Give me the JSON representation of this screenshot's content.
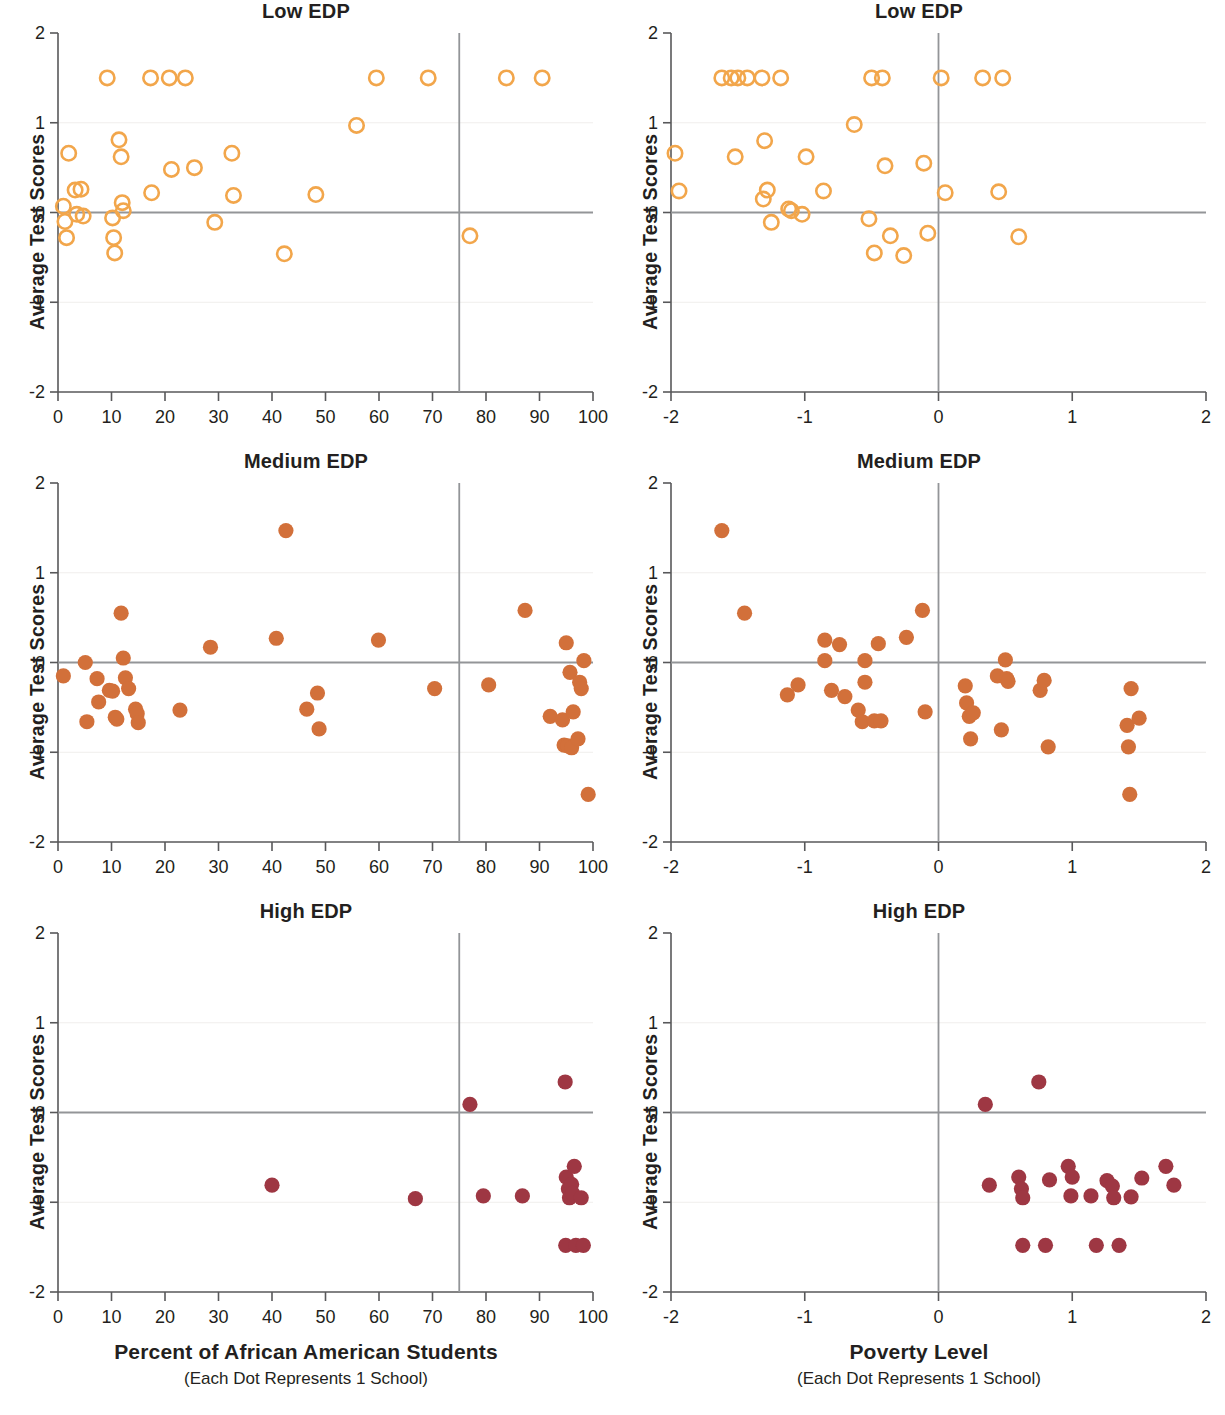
{
  "figure": {
    "background": "#ffffff",
    "columns": [
      {
        "id": "col-left",
        "axis_title": "Percent of African American Students",
        "axis_subtitle": "(Each Dot Represents 1 School)"
      },
      {
        "id": "col-right",
        "axis_title": "Poverty Level",
        "axis_subtitle": "(Each Dot Represents 1 School)"
      }
    ]
  },
  "chart_data": [
    {
      "id": "low-edp-race",
      "type": "scatter",
      "title": "Low EDP",
      "xlabel": "Percent of African American Students",
      "xsublabel": "(Each Dot Represents 1 School)",
      "ylabel": "Average Test Scores",
      "xlim": [
        0,
        100
      ],
      "ylim": [
        -2,
        2
      ],
      "xticks": [
        0,
        10,
        20,
        30,
        40,
        50,
        60,
        70,
        80,
        90,
        100
      ],
      "xtick_labels": [
        "0",
        "10",
        "20",
        "30",
        "40",
        "50",
        "60",
        "70",
        "80",
        "90",
        "100"
      ],
      "yticks": [
        -2,
        -1,
        0,
        1,
        2
      ],
      "ytick_labels": [
        "-2",
        "-1",
        "0",
        "1",
        "2"
      ],
      "grid": false,
      "legend": "none",
      "marker": "open-circle",
      "color": "#F2A64B",
      "reference_lines": {
        "vertical_x": 75,
        "horizontal_y": 0
      },
      "points": [
        [
          1.0,
          0.07
        ],
        [
          1.3,
          -0.1
        ],
        [
          1.6,
          -0.28
        ],
        [
          2.0,
          0.66
        ],
        [
          3.2,
          0.25
        ],
        [
          3.5,
          -0.02
        ],
        [
          4.3,
          0.26
        ],
        [
          4.7,
          -0.04
        ],
        [
          9.2,
          1.5
        ],
        [
          10.2,
          -0.06
        ],
        [
          10.4,
          -0.28
        ],
        [
          10.6,
          -0.45
        ],
        [
          11.4,
          0.81
        ],
        [
          11.8,
          0.62
        ],
        [
          12.0,
          0.11
        ],
        [
          12.2,
          0.02
        ],
        [
          17.3,
          1.5
        ],
        [
          17.5,
          0.22
        ],
        [
          20.8,
          1.5
        ],
        [
          21.2,
          0.48
        ],
        [
          23.8,
          1.5
        ],
        [
          25.5,
          0.5
        ],
        [
          29.3,
          -0.11
        ],
        [
          32.5,
          0.66
        ],
        [
          32.8,
          0.19
        ],
        [
          42.3,
          -0.46
        ],
        [
          48.2,
          0.2
        ],
        [
          55.8,
          0.97
        ],
        [
          59.5,
          1.5
        ],
        [
          69.2,
          1.5
        ],
        [
          77.0,
          -0.26
        ],
        [
          83.8,
          1.5
        ],
        [
          90.5,
          1.5
        ]
      ]
    },
    {
      "id": "low-edp-poverty",
      "type": "scatter",
      "title": "Low EDP",
      "xlabel": "Poverty Level",
      "xsublabel": "(Each Dot Represents 1 School)",
      "ylabel": "Average Test Scores",
      "xlim": [
        -2,
        2
      ],
      "ylim": [
        -2,
        2
      ],
      "xticks": [
        -2,
        -1,
        0,
        1,
        2
      ],
      "xtick_labels": [
        "-2",
        "-1",
        "0",
        "1",
        "2"
      ],
      "yticks": [
        -2,
        -1,
        0,
        1,
        2
      ],
      "ytick_labels": [
        "-2",
        "-1",
        "0",
        "1",
        "2"
      ],
      "grid": false,
      "legend": "none",
      "marker": "open-circle",
      "color": "#F2A64B",
      "reference_lines": {
        "vertical_x": 0,
        "horizontal_y": 0
      },
      "points": [
        [
          -1.97,
          0.66
        ],
        [
          -1.94,
          0.24
        ],
        [
          -1.62,
          1.5
        ],
        [
          -1.55,
          1.5
        ],
        [
          -1.52,
          0.62
        ],
        [
          -1.5,
          1.5
        ],
        [
          -1.43,
          1.5
        ],
        [
          -1.32,
          1.5
        ],
        [
          -1.3,
          0.8
        ],
        [
          -1.28,
          0.25
        ],
        [
          -1.31,
          0.15
        ],
        [
          -1.25,
          -0.11
        ],
        [
          -1.18,
          1.5
        ],
        [
          -1.12,
          0.04
        ],
        [
          -1.1,
          0.02
        ],
        [
          -1.02,
          -0.02
        ],
        [
          -0.99,
          0.62
        ],
        [
          -0.86,
          0.24
        ],
        [
          -0.63,
          0.98
        ],
        [
          -0.52,
          -0.07
        ],
        [
          -0.5,
          1.5
        ],
        [
          -0.48,
          -0.45
        ],
        [
          -0.42,
          1.5
        ],
        [
          -0.4,
          0.52
        ],
        [
          -0.36,
          -0.26
        ],
        [
          -0.26,
          -0.48
        ],
        [
          -0.11,
          0.55
        ],
        [
          -0.08,
          -0.23
        ],
        [
          0.02,
          1.5
        ],
        [
          0.05,
          0.22
        ],
        [
          0.33,
          1.5
        ],
        [
          0.45,
          0.23
        ],
        [
          0.48,
          1.5
        ],
        [
          0.6,
          -0.27
        ]
      ]
    },
    {
      "id": "medium-edp-race",
      "type": "scatter",
      "title": "Medium EDP",
      "xlabel": "Percent of African American Students",
      "xsublabel": "(Each Dot Represents 1 School)",
      "ylabel": "Average Test Scores",
      "xlim": [
        0,
        100
      ],
      "ylim": [
        -2,
        2
      ],
      "xticks": [
        0,
        10,
        20,
        30,
        40,
        50,
        60,
        70,
        80,
        90,
        100
      ],
      "xtick_labels": [
        "0",
        "10",
        "20",
        "30",
        "40",
        "50",
        "60",
        "70",
        "80",
        "90",
        "100"
      ],
      "yticks": [
        -2,
        -1,
        0,
        1,
        2
      ],
      "ytick_labels": [
        "-2",
        "-1",
        "0",
        "1",
        "2"
      ],
      "grid": false,
      "legend": "none",
      "marker": "filled-circle",
      "color": "#D2703A",
      "reference_lines": {
        "vertical_x": 75,
        "horizontal_y": 0
      },
      "points": [
        [
          1.0,
          -0.15
        ],
        [
          5.1,
          0.0
        ],
        [
          5.4,
          -0.66
        ],
        [
          7.3,
          -0.18
        ],
        [
          7.6,
          -0.44
        ],
        [
          9.6,
          -0.31
        ],
        [
          10.2,
          -0.32
        ],
        [
          10.7,
          -0.61
        ],
        [
          11.0,
          -0.63
        ],
        [
          11.8,
          0.55
        ],
        [
          12.2,
          0.05
        ],
        [
          12.6,
          -0.17
        ],
        [
          13.2,
          -0.29
        ],
        [
          14.5,
          -0.52
        ],
        [
          14.8,
          -0.57
        ],
        [
          15.0,
          -0.67
        ],
        [
          22.8,
          -0.53
        ],
        [
          28.5,
          0.17
        ],
        [
          40.8,
          0.27
        ],
        [
          42.6,
          1.47
        ],
        [
          46.5,
          -0.52
        ],
        [
          48.5,
          -0.34
        ],
        [
          48.8,
          -0.74
        ],
        [
          59.9,
          0.25
        ],
        [
          70.4,
          -0.29
        ],
        [
          80.5,
          -0.25
        ],
        [
          87.3,
          0.58
        ],
        [
          92.0,
          -0.6
        ],
        [
          94.3,
          -0.64
        ],
        [
          94.6,
          -0.92
        ],
        [
          95.0,
          0.22
        ],
        [
          95.3,
          -0.93
        ],
        [
          95.7,
          -0.11
        ],
        [
          96.0,
          -0.95
        ],
        [
          96.3,
          -0.55
        ],
        [
          97.2,
          -0.85
        ],
        [
          97.5,
          -0.22
        ],
        [
          97.8,
          -0.29
        ],
        [
          98.3,
          0.02
        ],
        [
          99.1,
          -1.47
        ]
      ]
    },
    {
      "id": "medium-edp-poverty",
      "type": "scatter",
      "title": "Medium EDP",
      "xlabel": "Poverty Level",
      "xsublabel": "(Each Dot Represents 1 School)",
      "ylabel": "Average Test Scores",
      "xlim": [
        -2,
        2
      ],
      "ylim": [
        -2,
        2
      ],
      "xticks": [
        -2,
        -1,
        0,
        1,
        2
      ],
      "xtick_labels": [
        "-2",
        "-1",
        "0",
        "1",
        "2"
      ],
      "yticks": [
        -2,
        -1,
        0,
        1,
        2
      ],
      "ytick_labels": [
        "-2",
        "-1",
        "0",
        "1",
        "2"
      ],
      "grid": false,
      "legend": "none",
      "marker": "filled-circle",
      "color": "#D2703A",
      "reference_lines": {
        "vertical_x": 0,
        "horizontal_y": 0
      },
      "points": [
        [
          -1.62,
          1.47
        ],
        [
          -1.45,
          0.55
        ],
        [
          -1.13,
          -0.36
        ],
        [
          -1.05,
          -0.25
        ],
        [
          -0.85,
          0.25
        ],
        [
          -0.85,
          0.02
        ],
        [
          -0.8,
          -0.31
        ],
        [
          -0.74,
          0.2
        ],
        [
          -0.7,
          -0.38
        ],
        [
          -0.6,
          -0.53
        ],
        [
          -0.57,
          -0.66
        ],
        [
          -0.55,
          0.02
        ],
        [
          -0.55,
          -0.22
        ],
        [
          -0.48,
          -0.65
        ],
        [
          -0.45,
          0.21
        ],
        [
          -0.43,
          -0.65
        ],
        [
          -0.24,
          0.28
        ],
        [
          -0.12,
          0.58
        ],
        [
          -0.1,
          -0.55
        ],
        [
          0.2,
          -0.26
        ],
        [
          0.21,
          -0.45
        ],
        [
          0.23,
          -0.6
        ],
        [
          0.24,
          -0.85
        ],
        [
          0.26,
          -0.56
        ],
        [
          0.44,
          -0.15
        ],
        [
          0.47,
          -0.75
        ],
        [
          0.5,
          0.03
        ],
        [
          0.51,
          -0.18
        ],
        [
          0.52,
          -0.21
        ],
        [
          0.76,
          -0.31
        ],
        [
          0.79,
          -0.2
        ],
        [
          0.82,
          -0.94
        ],
        [
          1.41,
          -0.7
        ],
        [
          1.42,
          -0.94
        ],
        [
          1.43,
          -1.47
        ],
        [
          1.44,
          -0.29
        ],
        [
          1.5,
          -0.62
        ]
      ]
    },
    {
      "id": "high-edp-race",
      "type": "scatter",
      "title": "High EDP",
      "xlabel": "Percent of African American Students",
      "xsublabel": "(Each Dot Represents 1 School)",
      "ylabel": "Average Test Scores",
      "xlim": [
        0,
        100
      ],
      "ylim": [
        -2,
        2
      ],
      "xticks": [
        0,
        10,
        20,
        30,
        40,
        50,
        60,
        70,
        80,
        90,
        100
      ],
      "xtick_labels": [
        "0",
        "10",
        "20",
        "30",
        "40",
        "50",
        "60",
        "70",
        "80",
        "90",
        "100"
      ],
      "yticks": [
        -2,
        -1,
        0,
        1,
        2
      ],
      "ytick_labels": [
        "-2",
        "-1",
        "0",
        "1",
        "2"
      ],
      "grid": false,
      "legend": "none",
      "marker": "filled-circle",
      "color": "#9E3743",
      "reference_lines": {
        "vertical_x": 75,
        "horizontal_y": 0
      },
      "points": [
        [
          40.0,
          -0.81
        ],
        [
          66.8,
          -0.96
        ],
        [
          77.0,
          0.09
        ],
        [
          79.5,
          -0.93
        ],
        [
          86.8,
          -0.93
        ],
        [
          94.8,
          0.34
        ],
        [
          94.9,
          -1.48
        ],
        [
          95.0,
          -0.72
        ],
        [
          95.4,
          -0.85
        ],
        [
          95.6,
          -0.95
        ],
        [
          96.0,
          -0.8
        ],
        [
          96.2,
          -0.9
        ],
        [
          96.5,
          -0.6
        ],
        [
          96.8,
          -1.48
        ],
        [
          97.8,
          -0.95
        ],
        [
          98.2,
          -1.48
        ]
      ]
    },
    {
      "id": "high-edp-poverty",
      "type": "scatter",
      "title": "High EDP",
      "xlabel": "Poverty Level",
      "xsublabel": "(Each Dot Represents 1 School)",
      "ylabel": "Average Test Scores",
      "xlim": [
        -2,
        2
      ],
      "ylim": [
        -2,
        2
      ],
      "xticks": [
        -2,
        -1,
        0,
        1,
        2
      ],
      "xtick_labels": [
        "-2",
        "-1",
        "0",
        "1",
        "2"
      ],
      "yticks": [
        -2,
        -1,
        0,
        1,
        2
      ],
      "ytick_labels": [
        "-2",
        "-1",
        "0",
        "1",
        "2"
      ],
      "grid": false,
      "legend": "none",
      "marker": "filled-circle",
      "color": "#9E3743",
      "reference_lines": {
        "vertical_x": 0,
        "horizontal_y": 0
      },
      "points": [
        [
          0.35,
          0.09
        ],
        [
          0.38,
          -0.81
        ],
        [
          0.6,
          -0.72
        ],
        [
          0.62,
          -0.85
        ],
        [
          0.63,
          -0.95
        ],
        [
          0.63,
          -1.48
        ],
        [
          0.75,
          0.34
        ],
        [
          0.8,
          -1.48
        ],
        [
          0.83,
          -0.75
        ],
        [
          0.97,
          -0.6
        ],
        [
          0.99,
          -0.93
        ],
        [
          1.0,
          -0.72
        ],
        [
          1.14,
          -0.93
        ],
        [
          1.18,
          -1.48
        ],
        [
          1.26,
          -0.76
        ],
        [
          1.3,
          -0.82
        ],
        [
          1.31,
          -0.95
        ],
        [
          1.35,
          -1.48
        ],
        [
          1.44,
          -0.94
        ],
        [
          1.52,
          -0.73
        ],
        [
          1.7,
          -0.6
        ],
        [
          1.76,
          -0.81
        ]
      ]
    }
  ]
}
